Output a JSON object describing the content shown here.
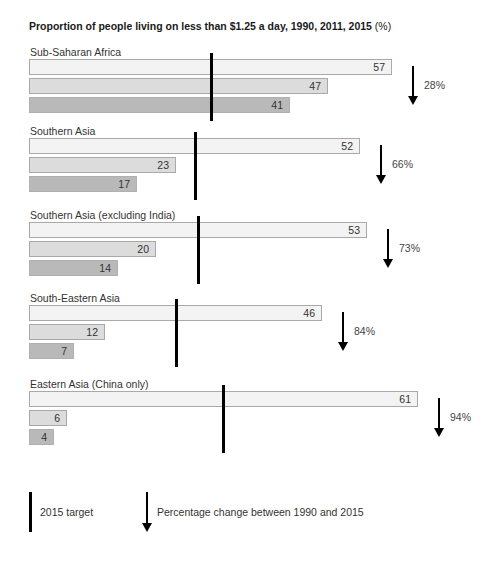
{
  "chart_data": {
    "type": "bar",
    "orientation": "horizontal",
    "title": "Proportion of people living on less than $1.25 a day, 1990, 2011, 2015 (%)",
    "xlabel": "",
    "ylabel": "",
    "grid": false,
    "series_names": [
      "1990",
      "2011",
      "2015"
    ],
    "series_colors": [
      "#f3f3f3",
      "#dcdcdc",
      "#b9b9b9"
    ],
    "categories": [
      "Sub-Saharan Africa",
      "Southern Asia",
      "Southern Asia (excluding India)",
      "South-Eastern Asia",
      "Eastern Asia (China only)"
    ],
    "series": [
      {
        "name": "1990",
        "values": [
          57,
          52,
          53,
          46,
          61
        ]
      },
      {
        "name": "2011",
        "values": [
          47,
          23,
          20,
          12,
          6
        ]
      },
      {
        "name": "2015",
        "values": [
          41,
          17,
          14,
          7,
          4
        ]
      }
    ],
    "targets_2015": [
      28.5,
      26,
      26.5,
      23,
      30.5
    ],
    "percentage_change_1990_2015": [
      "28%",
      "66%",
      "73%",
      "84%",
      "94%"
    ],
    "legend": [
      "2015 target",
      "Percentage change between 1990 and 2015"
    ],
    "legend_position": "bottom"
  },
  "title": {
    "main": "Proportion of people living on less than $1.25 a day, 1990, 2011, 2015",
    "unit": "(%)"
  },
  "groups": [
    {
      "label": "Sub-Saharan Africa",
      "v1990": "57",
      "v2011": "47",
      "v2015": "41",
      "change": "28%"
    },
    {
      "label": "Southern Asia",
      "v1990": "52",
      "v2011": "23",
      "v2015": "17",
      "change": "66%"
    },
    {
      "label": "Southern Asia (excluding India)",
      "v1990": "53",
      "v2011": "20",
      "v2015": "14",
      "change": "73%"
    },
    {
      "label": "South-Eastern Asia",
      "v1990": "46",
      "v2011": "12",
      "v2015": "7",
      "change": "84%"
    },
    {
      "label": "Eastern Asia (China only)",
      "v1990": "61",
      "v2011": "6",
      "v2015": "4",
      "change": "94%"
    }
  ],
  "legend": {
    "target_label": "2015 target",
    "change_label": "Percentage change between 1990 and 2015"
  }
}
